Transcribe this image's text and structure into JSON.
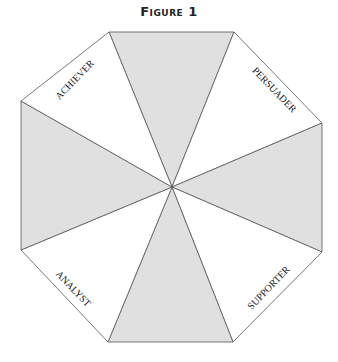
{
  "figure": {
    "title": "Figure 1",
    "labels": {
      "achiever": "ACHIEVER",
      "persuader": "PERSUADER",
      "analyst": "ANALYST",
      "supporter": "SUPPORTER"
    },
    "colors": {
      "shaded": "#e0e0e0",
      "white": "#ffffff",
      "stroke": "#555555"
    }
  }
}
